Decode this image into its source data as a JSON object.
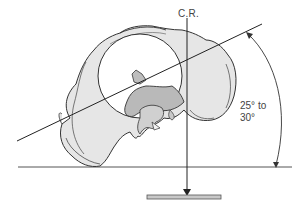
{
  "figure": {
    "central_ray_label": "C.R.",
    "angle_label_line1": "25° to",
    "angle_label_line2": "30°",
    "colors": {
      "bone_fill": "#e4e4e4",
      "bone_shadow": "#b8b8b8",
      "outline": "#333333",
      "line": "#222222",
      "receptor_fill": "#c8c8c8"
    }
  }
}
